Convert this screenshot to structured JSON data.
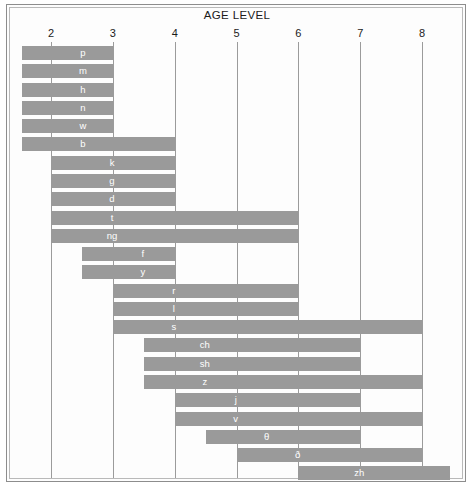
{
  "chart": {
    "title": "AGE LEVEL",
    "frame_color": "#8d8d8d",
    "bar_color": "#9a9a9a",
    "grid_color": "#9b9b9b",
    "label_color": "#ffffff"
  },
  "chart_data": {
    "type": "bar",
    "orientation": "horizontal",
    "title": "AGE LEVEL",
    "xlabel": "AGE LEVEL",
    "ylabel": "",
    "xlim": [
      1.5,
      8.4
    ],
    "grid": true,
    "legend": "none",
    "xticks": [
      2,
      3,
      4,
      5,
      6,
      7,
      8
    ],
    "xtick_labels": [
      "2",
      "3",
      "4",
      "5",
      "6",
      "7",
      "8"
    ],
    "categories": [
      "p",
      "m",
      "h",
      "n",
      "w",
      "b",
      "k",
      "g",
      "d",
      "t",
      "ng",
      "f",
      "y",
      "r",
      "l",
      "s",
      "ch",
      "sh",
      "z",
      "j",
      "v",
      "θ",
      "ð",
      "zh"
    ],
    "bars": [
      {
        "label": "p",
        "start": 1.53,
        "end": 3.0
      },
      {
        "label": "m",
        "start": 1.53,
        "end": 3.0
      },
      {
        "label": "h",
        "start": 1.53,
        "end": 3.0
      },
      {
        "label": "n",
        "start": 1.53,
        "end": 3.0
      },
      {
        "label": "w",
        "start": 1.53,
        "end": 3.0
      },
      {
        "label": "b",
        "start": 1.53,
        "end": 4.0
      },
      {
        "label": "k",
        "start": 2.0,
        "end": 4.0
      },
      {
        "label": "g",
        "start": 2.0,
        "end": 4.0
      },
      {
        "label": "d",
        "start": 2.0,
        "end": 4.0
      },
      {
        "label": "t",
        "start": 2.0,
        "end": 6.0
      },
      {
        "label": "ng",
        "start": 2.0,
        "end": 6.0
      },
      {
        "label": "f",
        "start": 2.5,
        "end": 4.0
      },
      {
        "label": "y",
        "start": 2.5,
        "end": 4.0
      },
      {
        "label": "r",
        "start": 3.0,
        "end": 6.0
      },
      {
        "label": "l",
        "start": 3.0,
        "end": 6.0
      },
      {
        "label": "s",
        "start": 3.0,
        "end": 8.0
      },
      {
        "label": "ch",
        "start": 3.5,
        "end": 7.0
      },
      {
        "label": "sh",
        "start": 3.5,
        "end": 7.0
      },
      {
        "label": "z",
        "start": 3.5,
        "end": 8.0
      },
      {
        "label": "j",
        "start": 4.0,
        "end": 7.0
      },
      {
        "label": "v",
        "start": 4.0,
        "end": 8.0
      },
      {
        "label": "θ",
        "start": 4.5,
        "end": 7.0
      },
      {
        "label": "ð",
        "start": 5.0,
        "end": 8.0
      },
      {
        "label": "zh",
        "start": 6.0,
        "end": 8.45
      }
    ]
  }
}
